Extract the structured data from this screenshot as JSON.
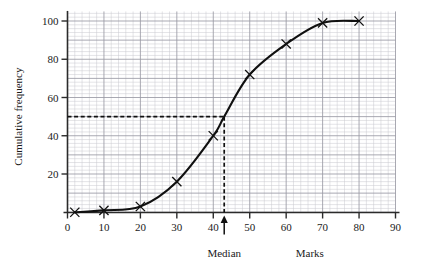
{
  "chart_data": {
    "type": "line",
    "title": "",
    "subtitle": "",
    "xlabel": "Marks",
    "ylabel": "Cumulative frequency",
    "xlim": [
      0,
      90
    ],
    "ylim": [
      0,
      105
    ],
    "xticks": [
      0,
      10,
      20,
      30,
      40,
      50,
      60,
      70,
      80,
      90
    ],
    "xticklabels": [
      "0",
      "10",
      "20",
      "30",
      "40",
      "50",
      "60",
      "70",
      "80",
      "90"
    ],
    "yticks": [
      20,
      40,
      60,
      80,
      100
    ],
    "yticklabels": [
      "20",
      "40",
      "60",
      "80",
      "100"
    ],
    "grid": true,
    "grid_minor_step_x": 2,
    "grid_minor_step_y": 2,
    "grid_major_step_x": 10,
    "grid_major_step_y": 10,
    "legend": false,
    "marker": "x",
    "series": [
      {
        "name": "Cumulative frequency",
        "x": [
          2,
          10,
          20,
          30,
          40,
          43,
          50,
          60,
          70,
          80
        ],
        "values": [
          0,
          1,
          3,
          16,
          40,
          50,
          72,
          88,
          99,
          100
        ]
      }
    ],
    "annotations": [
      {
        "name": "median-guide-horizontal",
        "kind": "dashed-line",
        "from": [
          0,
          50
        ],
        "to": [
          43,
          50
        ],
        "value_label": "50"
      },
      {
        "name": "median-guide-vertical",
        "kind": "dashed-line",
        "from": [
          43,
          50
        ],
        "to": [
          43,
          0
        ],
        "value_label": "43"
      },
      {
        "name": "median-arrow",
        "kind": "arrow-up",
        "at": [
          43,
          0
        ],
        "label": "Median"
      }
    ]
  },
  "labels": {
    "ylabel": "Cumulative frequency",
    "xlabel": "Marks",
    "median": "Median"
  },
  "colors": {
    "curve": "#101010",
    "grid_minor": "#c9c9cf",
    "grid_major": "#9a9aa4",
    "axis": "#2b2b2b",
    "background": "#ffffff",
    "text": "#1a1a1a"
  }
}
